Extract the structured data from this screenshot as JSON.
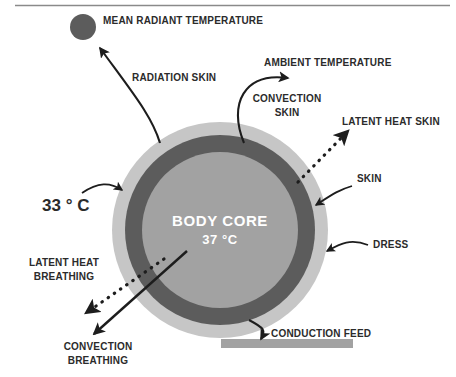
{
  "figure": {
    "top_rule": true
  },
  "colors": {
    "background": "#ffffff",
    "dress_ring": "#c6c6c6",
    "skin_ring": "#5c5c5c",
    "body_core": "#a2a2a2",
    "mean_radiant_dot": "#5c5c5c",
    "conduction_bar": "#a2a2a2",
    "arrow": "#1d1d1d",
    "text": "#2b2b2b",
    "core_text": "#ffffff",
    "rule": "#8a8a8a"
  },
  "body": {
    "core_title": "BODY CORE",
    "core_temperature": "37 °C",
    "skin_temperature": "33 ° C",
    "ring_labels": {
      "skin": "SKIN",
      "dress": "DRESS"
    }
  },
  "nodes": {
    "mean_radiant_temperature": "MEAN RADIANT TEMPERATURE",
    "ambient_temperature": "AMBIENT TEMPERATURE",
    "conduction_feed": "CONDUCTION FEED"
  },
  "flows": [
    {
      "id": "radiation-skin",
      "label": "RADIATION SKIN",
      "style": "solid",
      "target": "mean_radiant_temperature"
    },
    {
      "id": "convection-skin",
      "label": "CONVECTION\nSKIN",
      "style": "solid",
      "target": "ambient_temperature"
    },
    {
      "id": "latent-heat-skin",
      "label": "LATENT HEAT SKIN",
      "style": "dotted",
      "target": "ambient"
    },
    {
      "id": "latent-heat-breathing",
      "label": "LATENT HEAT\nBREATHING",
      "style": "dotted",
      "target": "ambient"
    },
    {
      "id": "convection-breathing",
      "label": "CONVECTION\nBREATHING",
      "style": "solid",
      "target": "ambient"
    },
    {
      "id": "conduction-feed",
      "label": "CONDUCTION FEED",
      "style": "solid",
      "target": "conduction_bar"
    }
  ],
  "labels": {
    "mean_radiant_temperature": "MEAN RADIANT TEMPERATURE",
    "radiation_skin": "RADIATION SKIN",
    "ambient_temperature": "AMBIENT TEMPERATURE",
    "convection_skin_l1": "CONVECTION",
    "convection_skin_l2": "SKIN",
    "latent_heat_skin": "LATENT HEAT SKIN",
    "skin": "SKIN",
    "dress": "DRESS",
    "skin_temperature": "33 ° C",
    "body_core": "BODY CORE",
    "body_core_temperature": "37 °C",
    "latent_heat_breathing_l1": "LATENT HEAT",
    "latent_heat_breathing_l2": "BREATHING",
    "convection_breathing_l1": "CONVECTION",
    "convection_breathing_l2": "BREATHING",
    "conduction_feed": "CONDUCTION FEED"
  }
}
